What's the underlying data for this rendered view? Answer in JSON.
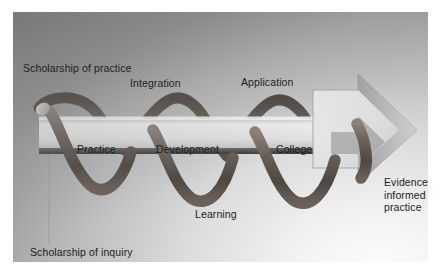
{
  "figure": {
    "background_color": "#ffffff",
    "panel_color_top_left": "#8a8a8a",
    "panel_color_bottom_right": "#fdfdfd"
  },
  "diagram": {
    "type": "process-spiral-arrow",
    "arrow_direction": "left-to-right",
    "arrow_color": "#e4e4e4",
    "spiral_color": "#6b6159",
    "text_color": "#1d1d1d",
    "spiral_turns": 3
  },
  "labels": {
    "scholarship_practice": "Scholarship of practice",
    "scholarship_inquiry": "Scholarship of inquiry",
    "integration": "Integration",
    "application": "Application",
    "learning": "Learning",
    "evidence_informed_practice": "Evidence informed practice"
  },
  "arrow_stages": {
    "stage_1": "Practice",
    "stage_2": "Development",
    "stage_3": "College"
  },
  "leader_line": {
    "name": "vertical-connector",
    "color": "#9a9a9a"
  }
}
